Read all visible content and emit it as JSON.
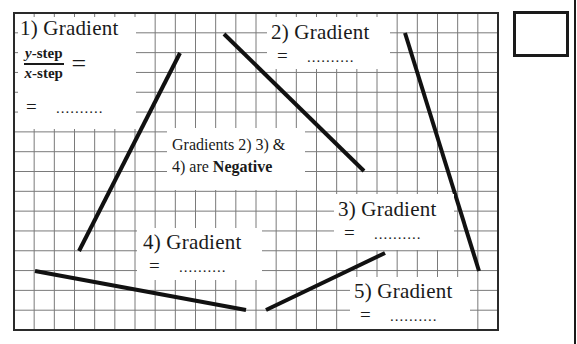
{
  "grid": {
    "left": 14,
    "top": 13,
    "right": 498,
    "bottom": 330,
    "spacing": 20,
    "line_color": "#7a7a7a",
    "border_color": "#2a2a2a"
  },
  "lines": [
    {
      "id": 1,
      "x1": 79,
      "y1": 251,
      "x2": 180,
      "y2": 53
    },
    {
      "id": 2,
      "x1": 224,
      "y1": 34,
      "x2": 364,
      "y2": 171
    },
    {
      "id": 3,
      "x1": 405,
      "y1": 33,
      "x2": 479,
      "y2": 271
    },
    {
      "id": 4,
      "x1": 35,
      "y1": 271,
      "x2": 246,
      "y2": 310
    },
    {
      "id": 5,
      "x1": 266,
      "y1": 310,
      "x2": 385,
      "y2": 253
    }
  ],
  "line_color": "#111111",
  "labels": {
    "g1": {
      "title": "1)  Gradient",
      "frac_num_var": "y",
      "frac_num_rest": "-step",
      "frac_den_var": "x",
      "frac_den_rest": "-step",
      "frac_eq": "=",
      "eq": "=",
      "dots": ".........."
    },
    "g2": {
      "title": "2)  Gradient",
      "eq": "=",
      "dots": ".........."
    },
    "g3": {
      "title": "3)  Gradient",
      "eq": "=",
      "dots": ".........."
    },
    "g4": {
      "title": "4)  Gradient",
      "eq": "=",
      "dots": ".........."
    },
    "g5": {
      "title": "5)  Gradient",
      "eq": "=",
      "dots": ".........."
    }
  },
  "note": {
    "line1": "Gradients 2) 3) &",
    "line2_prefix": "4) are ",
    "line2_bold": "Negative"
  }
}
